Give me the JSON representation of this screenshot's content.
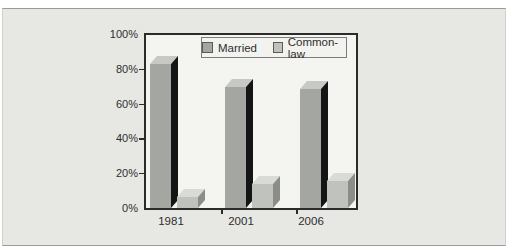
{
  "chart_data": {
    "type": "bar",
    "style": "3d-column",
    "categories": [
      "1981",
      "2001",
      "2006"
    ],
    "series": [
      {
        "name": "Married",
        "values": [
          83,
          70,
          68.5
        ],
        "color": "#a4a6a1",
        "top_color": "#c7c9c4",
        "side_color": "#141414"
      },
      {
        "name": "Common-law",
        "values": [
          6.5,
          14,
          15.5
        ],
        "color": "#c0c2bd",
        "top_color": "#d9dbd6",
        "side_color": "#8b8d88"
      }
    ],
    "title": "",
    "xlabel": "",
    "ylabel": "",
    "ylim": [
      0,
      100
    ],
    "y_ticks": [
      "0%",
      "20%",
      "40%",
      "60%",
      "80%",
      "100%"
    ],
    "grid": false,
    "legend_position": "top-center",
    "plot_background": "#f4f4f1",
    "panel_background": "#e7e7e4"
  }
}
